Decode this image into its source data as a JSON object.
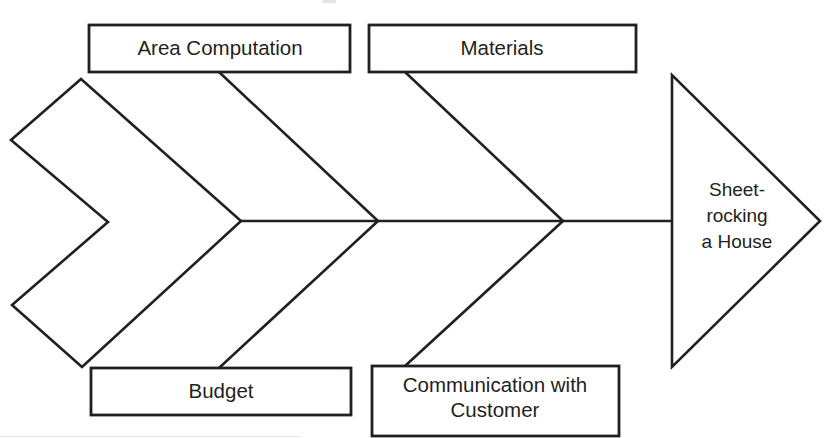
{
  "diagram": {
    "type": "fishbone-ishikawa",
    "effect": {
      "label_lines": [
        "Sheet-",
        "rocking",
        "a House"
      ],
      "full_label": "Sheet-rocking a House",
      "shape": "triangle-head"
    },
    "tail": {
      "shape": "chevron-tail",
      "label": ""
    },
    "spine": {
      "label": "",
      "y": 221
    },
    "categories": [
      {
        "id": "area-computation",
        "label": "Area Computation",
        "position": "top",
        "index": 0,
        "lines": [
          "Area Computation"
        ]
      },
      {
        "id": "materials",
        "label": "Materials",
        "position": "top",
        "index": 1,
        "lines": [
          "Materials"
        ]
      },
      {
        "id": "budget",
        "label": "Budget",
        "position": "bottom",
        "index": 0,
        "lines": [
          "Budget"
        ]
      },
      {
        "id": "communication-with-customer",
        "label": "Communication with Customer",
        "position": "bottom",
        "index": 1,
        "lines": [
          "Communication with",
          "Customer"
        ]
      }
    ],
    "colors": {
      "stroke": "#231f20",
      "fill": "#ffffff",
      "background": "#ffffff"
    }
  }
}
